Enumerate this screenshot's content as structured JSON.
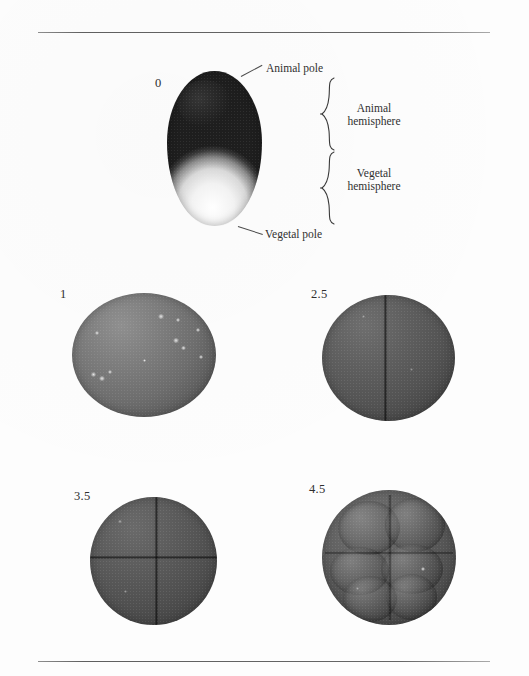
{
  "figure": {
    "type": "photographic-plate",
    "panels": [
      {
        "id": "panel-0",
        "time_label": "0",
        "description": "uncleaved fertilized egg with pigmented animal hemisphere and pale vegetal hemisphere",
        "annotations": [
          "Animal pole",
          "Animal hemisphere",
          "Vegetal hemisphere",
          "Vegetal pole"
        ]
      },
      {
        "id": "panel-1",
        "time_label": "1",
        "description": "uncleaved gray sphere with light speckles"
      },
      {
        "id": "panel-2-5",
        "time_label": "2.5",
        "description": "two-cell stage with vertical cleavage furrow"
      },
      {
        "id": "panel-3-5",
        "time_label": "3.5",
        "description": "four-cell stage with crossed cleavage furrows"
      },
      {
        "id": "panel-4-5",
        "time_label": "4.5",
        "description": "eight-cell stage with multiple blastomeres"
      }
    ]
  },
  "labels": {
    "stage_0": "0",
    "stage_1": "1",
    "stage_2_5": "2.5",
    "stage_3_5": "3.5",
    "stage_4_5": "4.5"
  },
  "annotations": {
    "animal_pole": "Animal pole",
    "vegetal_pole": "Vegetal pole",
    "animal_hemisphere_line1": "Animal",
    "animal_hemisphere_line2": "hemisphere",
    "vegetal_hemisphere_line1": "Vegetal",
    "vegetal_hemisphere_line2": "hemisphere"
  },
  "colors": {
    "page_background": "#fdfdfd",
    "rule": "#5f5f5f",
    "text": "#2e2e2e",
    "pigmented_pole": "#171717",
    "pale_pole": "#fafafa",
    "embryo_gray": "#5f5f5f"
  }
}
